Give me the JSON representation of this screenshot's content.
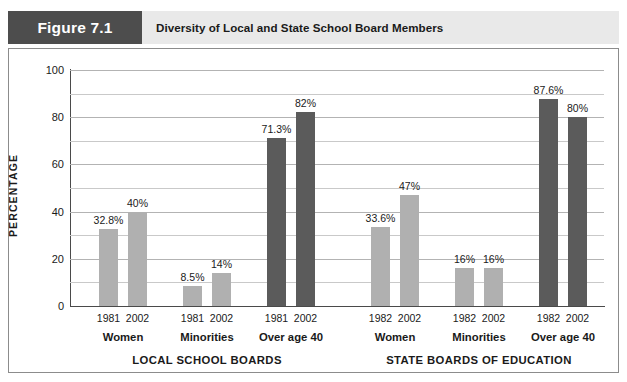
{
  "header": {
    "figure_tag": "Figure 7.1",
    "title": "Diversity of Local and State School Board Members"
  },
  "colors": {
    "bar_light": "#b0b0b0",
    "bar_dark": "#5b5b5b",
    "tag_background": "#4d4d4d",
    "header_background": "#e9e9e9",
    "axis": "#4a4a4a",
    "grid": "#c9c9c9"
  },
  "chart_data": {
    "type": "bar",
    "title": "Diversity of Local and State School Board Members",
    "xlabel": "",
    "ylabel": "PERCENTAGE",
    "ylim": [
      0,
      100
    ],
    "yticks": [
      0,
      20,
      40,
      60,
      80,
      100
    ],
    "ytick_labels": [
      "0",
      "20",
      "40",
      "60",
      "80",
      "100"
    ],
    "minor_gridlines": [
      10,
      30,
      50,
      70,
      90
    ],
    "grid": true,
    "legend": "none",
    "groups": [
      {
        "name": "LOCAL SCHOOL BOARDS",
        "categories": [
          {
            "label": "Women",
            "bars": [
              {
                "year": "1981",
                "value": 32.8,
                "value_label": "32.8%",
                "shade": "light"
              },
              {
                "year": "2002",
                "value": 40,
                "value_label": "40%",
                "shade": "light"
              }
            ]
          },
          {
            "label": "Minorities",
            "bars": [
              {
                "year": "1981",
                "value": 8.5,
                "value_label": "8.5%",
                "shade": "light"
              },
              {
                "year": "2002",
                "value": 14,
                "value_label": "14%",
                "shade": "light"
              }
            ]
          },
          {
            "label": "Over age 40",
            "bars": [
              {
                "year": "1981",
                "value": 71.3,
                "value_label": "71.3%",
                "shade": "dark"
              },
              {
                "year": "2002",
                "value": 82,
                "value_label": "82%",
                "shade": "dark"
              }
            ]
          }
        ]
      },
      {
        "name": "STATE BOARDS OF EDUCATION",
        "categories": [
          {
            "label": "Women",
            "bars": [
              {
                "year": "1982",
                "value": 33.6,
                "value_label": "33.6%",
                "shade": "light"
              },
              {
                "year": "2002",
                "value": 47,
                "value_label": "47%",
                "shade": "light"
              }
            ]
          },
          {
            "label": "Minorities",
            "bars": [
              {
                "year": "1982",
                "value": 16,
                "value_label": "16%",
                "shade": "light"
              },
              {
                "year": "2002",
                "value": 16,
                "value_label": "16%",
                "shade": "light"
              }
            ]
          },
          {
            "label": "Over age 40",
            "bars": [
              {
                "year": "1982",
                "value": 87.6,
                "value_label": "87.6%",
                "shade": "dark"
              },
              {
                "year": "2002",
                "value": 80,
                "value_label": "80%",
                "shade": "dark"
              }
            ]
          }
        ]
      }
    ]
  }
}
